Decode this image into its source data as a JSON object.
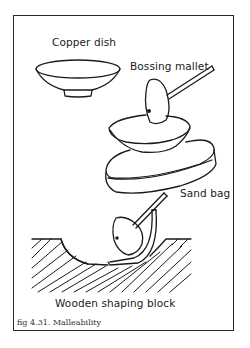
{
  "figure": {
    "caption": "fig 4.31.  Malleability",
    "labels": {
      "copper_dish": "Copper dish",
      "bossing_mallet": "Bossing mallet",
      "sand_bag": "Sand bag",
      "wooden_block": "Wooden shaping block"
    },
    "colors": {
      "line": "#1a1a1a",
      "background": "#ffffff"
    }
  }
}
